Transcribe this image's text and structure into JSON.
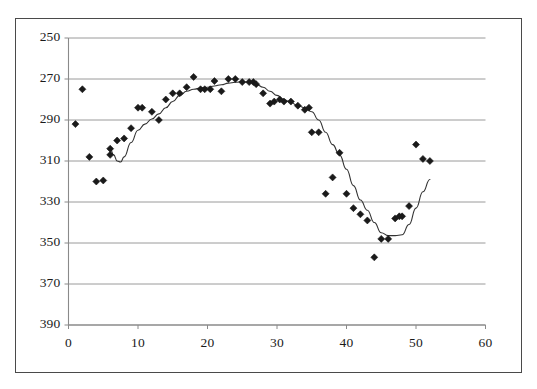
{
  "chart_data": {
    "type": "scatter",
    "title": "",
    "xlabel": "",
    "ylabel": "",
    "xlim": [
      0,
      60
    ],
    "ylim": [
      250,
      390
    ],
    "xticks": [
      0,
      10,
      20,
      30,
      40,
      50,
      60
    ],
    "yticks": [
      250,
      270,
      290,
      310,
      330,
      350,
      370,
      390
    ],
    "grid": "horizontal",
    "legend": "none",
    "marker": "diamond",
    "marker_color": "#1a1a1a",
    "line_color": "#333333",
    "series": [
      {
        "name": "observations",
        "type": "scatter",
        "x": [
          1,
          2,
          3,
          4,
          5,
          6,
          6,
          7,
          8,
          9,
          10,
          10.6,
          12,
          13,
          14,
          15,
          16,
          17,
          18,
          19,
          19.6,
          20.4,
          21,
          22,
          23,
          24,
          25,
          26,
          26.6,
          27,
          28,
          29,
          29.6,
          30.4,
          31,
          32,
          33,
          34,
          34.6,
          35,
          36,
          37,
          38,
          39,
          40,
          41,
          42,
          43,
          44,
          45,
          46,
          47,
          47.6,
          48,
          49,
          50,
          51,
          52
        ],
        "y": [
          348,
          365,
          332,
          320,
          320.5,
          333,
          336,
          340,
          341,
          346,
          356,
          356,
          354,
          350,
          360,
          363,
          363,
          366,
          371,
          365,
          365,
          365,
          369,
          364,
          370,
          370,
          368.5,
          368.5,
          368.5,
          367.5,
          363,
          358,
          359,
          360,
          359,
          359,
          357,
          355,
          356,
          344,
          344,
          314,
          322,
          334,
          314,
          307,
          304,
          301,
          283,
          292,
          292,
          302,
          303,
          303,
          308,
          338,
          331,
          330
        ]
      },
      {
        "name": "fitted-trend",
        "type": "line",
        "x": [
          6,
          6.5,
          7,
          7.5,
          8,
          9,
          10,
          11,
          12,
          13,
          14,
          15,
          16,
          17,
          18,
          19,
          20,
          21,
          22,
          23,
          24,
          25,
          26,
          27,
          28,
          29,
          30,
          31,
          32,
          33,
          34,
          35,
          36,
          37,
          38,
          39,
          40,
          41,
          42,
          43,
          44,
          45,
          46,
          47,
          48,
          49,
          50,
          51,
          52
        ],
        "y": [
          336,
          333,
          330,
          329.5,
          332,
          339,
          345,
          348,
          350.5,
          353,
          356,
          359,
          362,
          364,
          365,
          365.6,
          366,
          366.6,
          367.2,
          368,
          368.4,
          368.6,
          368.4,
          367.4,
          366,
          364,
          362,
          360,
          358.5,
          357,
          356,
          354,
          350,
          344,
          338,
          333,
          326,
          318,
          311,
          306,
          300,
          295,
          293.6,
          293.6,
          294,
          299,
          307,
          315,
          321
        ]
      }
    ]
  },
  "axis": {
    "y_tick_labels": [
      "390",
      "370",
      "350",
      "330",
      "310",
      "290",
      "270",
      "250"
    ],
    "x_tick_labels": [
      "0",
      "10",
      "20",
      "30",
      "40",
      "50",
      "60"
    ]
  }
}
